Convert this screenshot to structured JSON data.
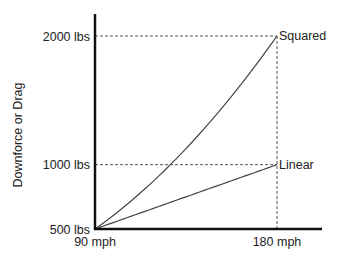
{
  "chart_data": {
    "type": "line",
    "title": "",
    "xlabel": "",
    "ylabel": "Downforce or Drag",
    "x_ticks": [
      {
        "value": 90,
        "label": "90 mph"
      },
      {
        "value": 180,
        "label": "180 mph"
      }
    ],
    "y_ticks": [
      {
        "value": 500,
        "label": "500 lbs"
      },
      {
        "value": 1000,
        "label": "1000 lbs"
      },
      {
        "value": 2000,
        "label": "2000 lbs"
      }
    ],
    "xlim": [
      90,
      214
    ],
    "ylim": [
      500,
      2200
    ],
    "grid": false,
    "series": [
      {
        "name": "Squared",
        "model": "F = 500*(v/90)^2",
        "x": [
          90,
          180
        ],
        "y": [
          500,
          2000
        ]
      },
      {
        "name": "Linear",
        "model": "F = 500*(v/90)",
        "x": [
          90,
          180
        ],
        "y": [
          500,
          1000
        ]
      }
    ],
    "reference_lines": [
      {
        "type": "horizontal",
        "value": 2000,
        "from_x": 90,
        "to_x": 180
      },
      {
        "type": "horizontal",
        "value": 1000,
        "from_x": 90,
        "to_x": 180
      },
      {
        "type": "vertical",
        "value": 180,
        "from_y": 500,
        "to_y": 2000
      }
    ],
    "colors": {
      "axis": "#111111",
      "line": "#444444",
      "dashed": "#555555",
      "text": "#222222"
    }
  }
}
